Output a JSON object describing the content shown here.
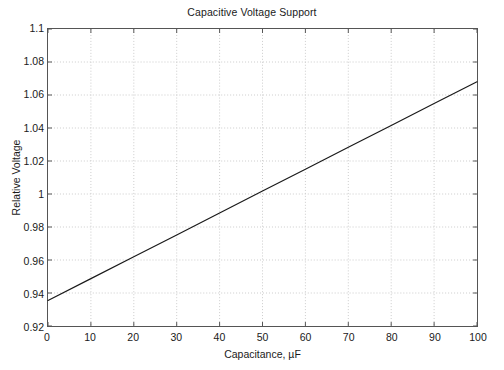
{
  "chart_data": {
    "type": "line",
    "title": "Capacitive Voltage Support",
    "xlabel": "Capacitance, µF",
    "ylabel": "Relative Voltage",
    "xlim": [
      0,
      100
    ],
    "ylim": [
      0.92,
      1.1
    ],
    "xticks": [
      0,
      10,
      20,
      30,
      40,
      50,
      60,
      70,
      80,
      90,
      100
    ],
    "xtick_labels": [
      "0",
      "10",
      "20",
      "30",
      "40",
      "50",
      "60",
      "70",
      "80",
      "90",
      "100"
    ],
    "yticks": [
      0.92,
      0.94,
      0.96,
      0.98,
      1.0,
      1.02,
      1.04,
      1.06,
      1.08,
      1.1
    ],
    "ytick_labels": [
      "0.92",
      "0.94",
      "0.96",
      "0.98",
      "1",
      "1.02",
      "1.04",
      "1.06",
      "1.08",
      "1.1"
    ],
    "grid": true,
    "legend": null,
    "series": [
      {
        "name": "Relative Voltage",
        "color": "#1a1a1a",
        "x": [
          0,
          10,
          20,
          30,
          40,
          50,
          60,
          70,
          80,
          90,
          100
        ],
        "values": [
          0.9355,
          0.9487,
          0.962,
          0.9752,
          0.9885,
          1.0018,
          1.015,
          1.0283,
          1.0415,
          1.0548,
          1.068
        ]
      }
    ]
  },
  "figure": {
    "background_color": "#ffffff",
    "axis_color": "#555555",
    "grid_color": "#cccccc",
    "text_color": "#1a1a1a"
  }
}
